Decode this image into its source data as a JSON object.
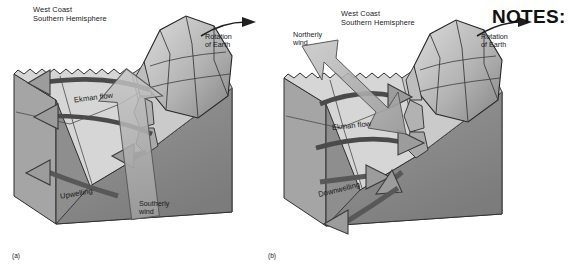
{
  "figure": {
    "type": "block-diagram",
    "notes_label": "NOTES:",
    "colors": {
      "background": "#ffffff",
      "water_top": "#d8d8d8",
      "land_face": "#b9b9b9",
      "seafloor_dark": "#8f8f8f",
      "block_side": "#a8a8a8",
      "mountain_light": "#cfcfcf",
      "mountain_shadow": "#8a8a8a",
      "arrow_fill": "#9a9a9a",
      "arrow_stroke": "#3a3a3a",
      "wind_arrow_fill": "#b0b0b0",
      "text": "#1a1a1a"
    }
  },
  "panels": [
    {
      "id": "a",
      "panel_label": "(a)",
      "title_line1": "West Coast",
      "title_line2": "Southern Hemisphere",
      "rotation_line1": "Rotation",
      "rotation_line2": "of Earth",
      "ekman_label": "Ekman flow",
      "ekman_direction": "offshore (away from coast, to the left)",
      "wind_line1": "Southerly",
      "wind_line2": "wind",
      "wind_direction": "from the south, blowing toward the viewer/up-coast",
      "vertical_label": "Upwelling",
      "vertical_direction": "deep water rises toward the surface near the coast"
    },
    {
      "id": "b",
      "panel_label": "(b)",
      "title_line1": "West Coast",
      "title_line2": "Southern Hemisphere",
      "rotation_line1": "Rotation",
      "rotation_line2": "of Earth",
      "ekman_label": "Ekman flow",
      "ekman_direction": "onshore (toward the coast, to the right)",
      "wind_line1": "Northerly",
      "wind_line2": "wind",
      "wind_direction": "from the north, blowing down-coast",
      "vertical_label": "Downwelling",
      "vertical_direction": "surface water sinks along the coast"
    }
  ]
}
